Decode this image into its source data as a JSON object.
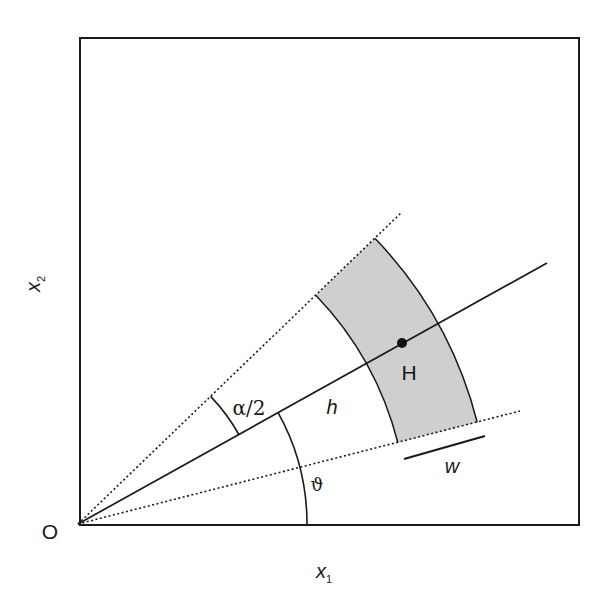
{
  "figure": {
    "type": "geometric-diagram",
    "labels": {
      "origin": "O",
      "x_axis": "x",
      "x_axis_sub": "1",
      "y_axis": "x",
      "y_axis_sub": "2",
      "half_angle": "α/2",
      "direction_angle": "ϑ",
      "distance": "h",
      "point": "H",
      "band_width": "w"
    },
    "colors": {
      "stroke": "#1a1a1a",
      "band_fill": "#cfcfcf",
      "background": "#ffffff"
    },
    "geometry": {
      "origin_px": [
        78,
        524
      ],
      "frame": {
        "x": 80,
        "y": 38,
        "width": 499,
        "height": 487
      },
      "center_angle_deg": 29.1,
      "half_angle_deg": 14.8,
      "band_inner_radius_px": 330,
      "band_outer_radius_px": 412,
      "point_H_radius_px": 371,
      "alpha_arc_radius_px": 184,
      "theta_arc_radius_px": 229
    }
  }
}
